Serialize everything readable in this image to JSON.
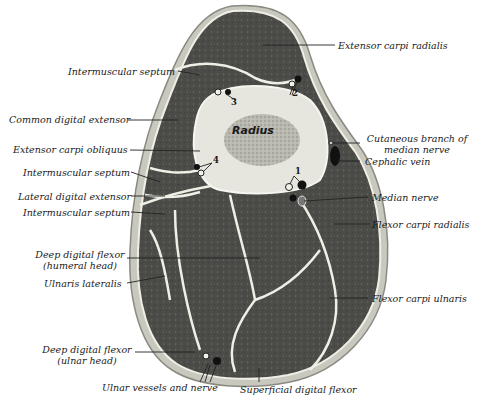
{
  "figure": {
    "bone": "Radius",
    "numbers": [
      "1",
      "2",
      "3",
      "4"
    ],
    "labels": {
      "extensor_carpi_radialis": "Extensor carpi radialis",
      "intermuscular_septum_top": "Intermuscular septum",
      "common_digital_extensor": "Common digital extensor",
      "extensor_carpi_obliquus": "Extensor carpi obliquus",
      "intermuscular_septum_mid": "Intermuscular septum",
      "lateral_digital_extensor": "Lateral digital extensor",
      "intermuscular_septum_low": "Intermuscular septum",
      "deep_digital_flexor_humeral_1": "Deep digital flexor",
      "deep_digital_flexor_humeral_2": "(humeral head)",
      "ulnaris_lateralis": "Ulnaris lateralis",
      "deep_digital_flexor_ulnar_1": "Deep digital flexor",
      "deep_digital_flexor_ulnar_2": "(ulnar head)",
      "ulnar_vessels_and_nerve": "Ulnar vessels and nerve",
      "superficial_digital_flexor": "Superficial digital flexor",
      "flexor_carpi_ulnaris": "Flexor carpi ulnaris",
      "flexor_carpi_radialis": "Flexor carpi radialis",
      "median_nerve": "Median nerve",
      "cephalic_vein": "Cephalic vein",
      "cutaneous_branch_1": "Cutaneous branch of",
      "cutaneous_branch_2": "median nerve"
    },
    "caption": "Fig. 00.—Cross-section of forearm of horse (cut off)"
  },
  "colors": {
    "muscle": "#4a4a4a",
    "skin": "#c9c9c0",
    "bone": "#e6e6e0",
    "marrow": "#a8a8a0",
    "septum": "#efefe6"
  }
}
